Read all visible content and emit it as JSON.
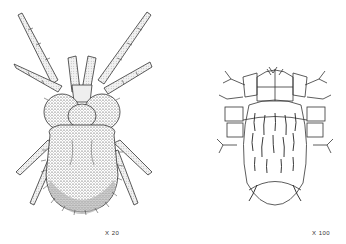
{
  "figures": [
    {
      "id": "mite-stippled",
      "description": "Stippled drawing of a hairy mite with long segmented legs",
      "caption": "X 20"
    },
    {
      "id": "mite-line",
      "description": "Line drawing of a mite with segmented body and setae",
      "caption": "X 100"
    }
  ],
  "colors": {
    "ink": "#222222",
    "background": "#ffffff"
  }
}
